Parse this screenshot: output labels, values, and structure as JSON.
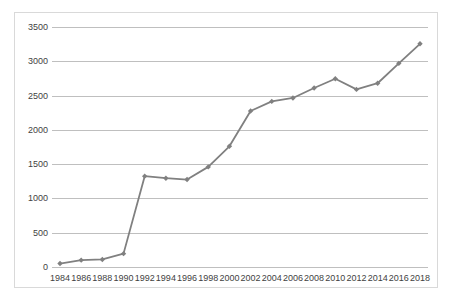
{
  "chart_data": {
    "type": "line",
    "title": "",
    "subtitle": "",
    "xlabel": "",
    "ylabel": "",
    "xlim": [
      1984,
      2018
    ],
    "ylim": [
      0,
      3500
    ],
    "ytick_labels": [
      "0",
      "500",
      "1000",
      "1500",
      "2000",
      "2500",
      "3000",
      "3500"
    ],
    "yticks": [
      0,
      500,
      1000,
      1500,
      2000,
      2500,
      3000,
      3500
    ],
    "categories": [
      "1984",
      "1986",
      "1988",
      "1990",
      "1992",
      "1994",
      "1996",
      "1998",
      "2000",
      "2002",
      "2004",
      "2006",
      "2008",
      "2010",
      "2012",
      "2014",
      "2016",
      "2018"
    ],
    "x": [
      1984,
      1986,
      1988,
      1990,
      1992,
      1994,
      1996,
      1998,
      2000,
      2002,
      2004,
      2006,
      2008,
      2010,
      2012,
      2014,
      2016,
      2018
    ],
    "values": [
      50,
      100,
      110,
      195,
      1325,
      1295,
      1275,
      1460,
      1760,
      2275,
      2415,
      2465,
      2610,
      2745,
      2590,
      2680,
      2970,
      3255
    ],
    "series": [
      {
        "name": "Series 1",
        "color": "#808080",
        "marker": "diamond",
        "values": [
          50,
          100,
          110,
          195,
          1325,
          1295,
          1275,
          1460,
          1760,
          2275,
          2415,
          2465,
          2610,
          2745,
          2590,
          2680,
          2970,
          3255
        ]
      }
    ],
    "grid": {
      "horizontal": true,
      "vertical": false,
      "color": "#bfbfbf"
    },
    "legend": {
      "visible": false,
      "position": "none"
    },
    "colors": {
      "line": "#808080",
      "marker": "#808080",
      "gridline": "#bfbfbf",
      "axis_text": "#3f3f3f",
      "plot_background": "#ffffff",
      "frame_border": "#d9d9d9"
    }
  }
}
